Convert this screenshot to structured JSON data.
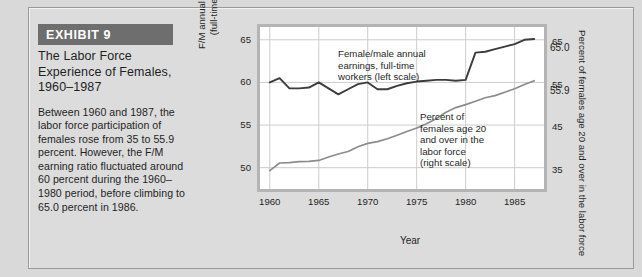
{
  "exhibit": {
    "band_label": "EXHIBIT 9",
    "title_lines": [
      "The Labor Force",
      "Experience of Females,",
      "1960–1987"
    ],
    "body": "Between 1960 and 1987, the labor force participation of females rose from 35 to 55.9 percent. However, the F/M earning ratio fluctuated around 60 percent during the 1960–1980 period, before climbing to 65.0 percent in 1986."
  },
  "colors": {
    "page_background": "#d9d9d9",
    "band_fill": "#6e6e6e",
    "band_text": "#ffffff",
    "plot_background": "#ffffff",
    "plot_bezel": "#b4b4b4",
    "gridline": "#cccccc",
    "earnings_line": "#3c3c3c",
    "participation_line": "#8c8c8c",
    "text": "#1f1f1f"
  },
  "chart_data": {
    "type": "line",
    "title": "",
    "xlabel": "Year",
    "grid": true,
    "legend_position": "inline-annotations",
    "x": [
      1960,
      1961,
      1962,
      1963,
      1964,
      1965,
      1966,
      1967,
      1968,
      1969,
      1970,
      1971,
      1972,
      1973,
      1974,
      1975,
      1976,
      1977,
      1978,
      1979,
      1980,
      1981,
      1982,
      1983,
      1984,
      1985,
      1986,
      1987
    ],
    "xlim": [
      1959,
      1988
    ],
    "xticks": [
      1960,
      1965,
      1970,
      1975,
      1980,
      1985
    ],
    "xticklabels": [
      "1960",
      "1965",
      "1970",
      "1975",
      "1980",
      "1985"
    ],
    "left_axis": {
      "label_lines": [
        "F/M annual earning ratio",
        "(full-time workers)"
      ],
      "ticks": [
        50,
        55,
        60,
        65
      ],
      "ticklabels": [
        "50",
        "55",
        "60",
        "65"
      ],
      "ylim": [
        47.5,
        66.5
      ]
    },
    "right_axis": {
      "label": "Percent of females age 20 and over in the labor force",
      "ticks": [
        35,
        45,
        55,
        65
      ],
      "ticklabels": [
        "35",
        "45",
        "55",
        "65"
      ],
      "ylim": [
        30.5,
        68.5
      ]
    },
    "series": [
      {
        "name": "Female/male annual earnings, full-time workers (left scale)",
        "axis": "left",
        "color": "#3c3c3c",
        "annotation_lines": [
          "Female/male annual",
          "earnings, full-time",
          "workers (left scale)"
        ],
        "end_label": "65.0",
        "values": [
          60.0,
          60.5,
          59.3,
          59.3,
          59.4,
          60.0,
          59.3,
          58.6,
          59.2,
          59.8,
          60.0,
          59.2,
          59.2,
          59.6,
          59.9,
          60.1,
          60.2,
          60.3,
          60.3,
          60.2,
          60.3,
          63.5,
          63.6,
          63.9,
          64.2,
          64.5,
          65.0,
          65.1
        ]
      },
      {
        "name": "Percent of females age 20 and over in the labor force (right scale)",
        "axis": "right",
        "color": "#8c8c8c",
        "annotation_lines": [
          "Percent of",
          "females age 20",
          "and over in the",
          "labor force",
          "(right scale)"
        ],
        "end_label": "55.9",
        "values": [
          34.8,
          36.6,
          36.7,
          36.9,
          37.0,
          37.2,
          38.0,
          38.7,
          39.3,
          40.4,
          41.2,
          41.6,
          42.3,
          43.1,
          44.0,
          44.8,
          45.8,
          47.0,
          48.5,
          49.6,
          50.3,
          51.1,
          51.9,
          52.4,
          53.2,
          54.0,
          55.0,
          55.9
        ]
      }
    ]
  }
}
